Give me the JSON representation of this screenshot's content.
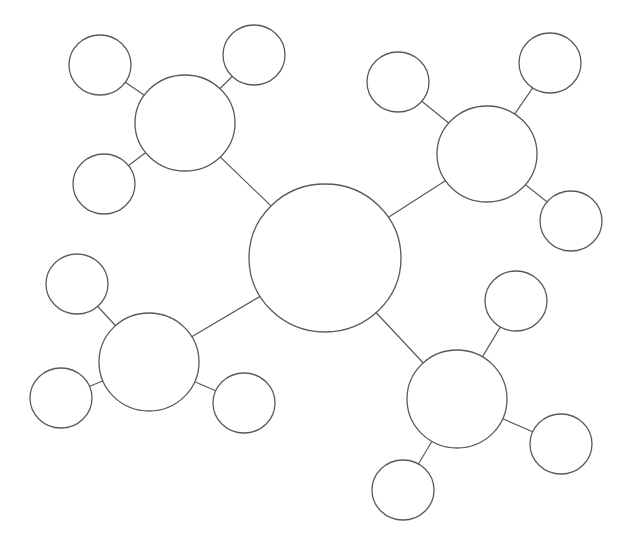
{
  "diagram": {
    "type": "bubble-map",
    "canvas": {
      "width": 629,
      "height": 551,
      "background": "#ffffff"
    },
    "colors": {
      "stroke": "#5a5a5a",
      "fill": "#ffffff"
    },
    "center": {
      "id": "center",
      "cx": 325,
      "cy": 258,
      "rx": 76,
      "ry": 74,
      "label": ""
    },
    "hubs": [
      {
        "id": "hub-top-left",
        "cx": 185,
        "cy": 123,
        "rx": 50,
        "ry": 48,
        "label": "",
        "leaves": [
          {
            "id": "leaf-tl-1",
            "cx": 100,
            "cy": 65,
            "rx": 31,
            "ry": 30,
            "label": ""
          },
          {
            "id": "leaf-tl-2",
            "cx": 254,
            "cy": 55,
            "rx": 31,
            "ry": 30,
            "label": ""
          },
          {
            "id": "leaf-tl-3",
            "cx": 104,
            "cy": 184,
            "rx": 31,
            "ry": 30,
            "label": ""
          }
        ]
      },
      {
        "id": "hub-top-right",
        "cx": 487,
        "cy": 154,
        "rx": 50,
        "ry": 48,
        "label": "",
        "leaves": [
          {
            "id": "leaf-tr-1",
            "cx": 398,
            "cy": 82,
            "rx": 31,
            "ry": 30,
            "label": ""
          },
          {
            "id": "leaf-tr-2",
            "cx": 550,
            "cy": 63,
            "rx": 31,
            "ry": 30,
            "label": ""
          },
          {
            "id": "leaf-tr-3",
            "cx": 571,
            "cy": 221,
            "rx": 31,
            "ry": 30,
            "label": ""
          }
        ]
      },
      {
        "id": "hub-bottom-left",
        "cx": 149,
        "cy": 362,
        "rx": 50,
        "ry": 49,
        "label": "",
        "leaves": [
          {
            "id": "leaf-bl-1",
            "cx": 77,
            "cy": 284,
            "rx": 31,
            "ry": 30,
            "label": ""
          },
          {
            "id": "leaf-bl-2",
            "cx": 61,
            "cy": 398,
            "rx": 31,
            "ry": 30,
            "label": ""
          },
          {
            "id": "leaf-bl-3",
            "cx": 244,
            "cy": 403,
            "rx": 31,
            "ry": 30,
            "label": ""
          }
        ]
      },
      {
        "id": "hub-bottom-right",
        "cx": 457,
        "cy": 399,
        "rx": 50,
        "ry": 49,
        "label": "",
        "leaves": [
          {
            "id": "leaf-br-1",
            "cx": 516,
            "cy": 301,
            "rx": 31,
            "ry": 30,
            "label": ""
          },
          {
            "id": "leaf-br-2",
            "cx": 561,
            "cy": 444,
            "rx": 31,
            "ry": 30,
            "label": ""
          },
          {
            "id": "leaf-br-3",
            "cx": 403,
            "cy": 490,
            "rx": 31,
            "ry": 30,
            "label": ""
          }
        ]
      }
    ]
  }
}
